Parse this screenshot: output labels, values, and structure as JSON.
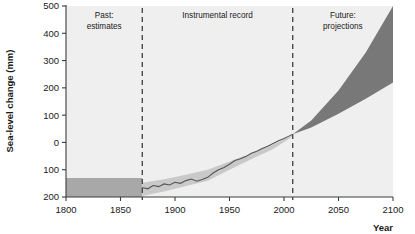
{
  "chart_data": {
    "type": "area",
    "title": "",
    "xlabel": "Year",
    "ylabel": "Sea-level change (mm)",
    "xlim": [
      1800,
      2100
    ],
    "ylim": [
      -200,
      500
    ],
    "grid": false,
    "legend": "none",
    "xticks": [
      1800,
      1850,
      1900,
      1950,
      2000,
      2050,
      2100
    ],
    "xtick_labels": [
      "1800",
      "1850",
      "1900",
      "1950",
      "2000",
      "2050",
      "2100"
    ],
    "yticks": [
      500,
      400,
      300,
      200,
      100,
      0,
      -100,
      -200
    ],
    "ytick_labels": [
      "500",
      "400",
      "300",
      "200",
      "100",
      "0",
      "100",
      "200"
    ],
    "zones": [
      {
        "name": "past-estimates",
        "label": "Past:\nestimates",
        "label_line1": "Past:",
        "label_line2": "estimates",
        "x_start": 1800,
        "x_end": 1870
      },
      {
        "name": "instrumental-record",
        "label": "Instrumental record",
        "label_line1": "Instrumental record",
        "label_line2": "",
        "x_start": 1870,
        "x_end": 2008
      },
      {
        "name": "future-projections",
        "label": "Future:\nprojections",
        "label_line1": "Future:",
        "label_line2": "projections",
        "x_start": 2008,
        "x_end": 2100
      }
    ],
    "dividers": [
      1870,
      2008
    ],
    "series": [
      {
        "name": "Past estimates band",
        "kind": "band",
        "color": "#a8a8a8",
        "x": [
          1800,
          1870
        ],
        "upper": [
          -130,
          -130
        ],
        "lower": [
          -200,
          -200
        ]
      },
      {
        "name": "Instrumental record uncertainty",
        "kind": "band",
        "color": "#c9c9c9",
        "x": [
          1870,
          1890,
          1910,
          1930,
          1950,
          1970,
          1990,
          2008
        ],
        "upper": [
          -148,
          -135,
          -118,
          -100,
          -70,
          -40,
          -8,
          26
        ],
        "lower": [
          -196,
          -180,
          -160,
          -140,
          -100,
          -62,
          -24,
          22
        ]
      },
      {
        "name": "Instrumental record",
        "kind": "line",
        "color": "#555555",
        "x": [
          1870,
          1875,
          1880,
          1885,
          1890,
          1895,
          1900,
          1905,
          1910,
          1915,
          1920,
          1925,
          1930,
          1935,
          1940,
          1945,
          1950,
          1955,
          1960,
          1965,
          1970,
          1975,
          1980,
          1985,
          1990,
          1995,
          2000,
          2005,
          2008
        ],
        "values": [
          -165,
          -170,
          -158,
          -162,
          -152,
          -156,
          -146,
          -150,
          -140,
          -134,
          -142,
          -136,
          -128,
          -112,
          -100,
          -92,
          -80,
          -66,
          -60,
          -52,
          -40,
          -32,
          -22,
          -14,
          -4,
          6,
          14,
          24,
          30
        ]
      },
      {
        "name": "Future projections range",
        "kind": "band",
        "color": "#787878",
        "x": [
          2008,
          2025,
          2050,
          2075,
          2100
        ],
        "upper": [
          30,
          80,
          190,
          330,
          500
        ],
        "lower": [
          30,
          55,
          105,
          160,
          220
        ]
      }
    ],
    "annotations": [
      {
        "text": "Past: estimates",
        "x": 1835,
        "y": 480
      },
      {
        "text": "Instrumental record",
        "x": 1939,
        "y": 480
      },
      {
        "text": "Future: projections",
        "x": 2054,
        "y": 480
      }
    ],
    "colors": {
      "plot_background": "#efefef",
      "past_band": "#a8a8a8",
      "instrumental_band": "#c9c9c9",
      "instrumental_line": "#555555",
      "projection_wedge": "#787878",
      "axis": "#3c3c3c",
      "divider": "#4a4a4a",
      "text": "#1a1a1a"
    }
  }
}
